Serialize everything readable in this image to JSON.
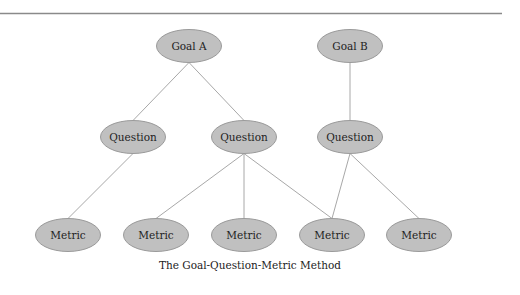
{
  "diagram": {
    "caption": "The Goal-Question-Metric Method",
    "colors": {
      "node_fill": "#c0c0c0",
      "node_stroke": "#9a9a9a",
      "edge": "#a8a8a8",
      "rule": "#8a8a8a"
    },
    "nodes": [
      {
        "id": "goal-a",
        "label": "Goal A",
        "cx": 189,
        "cy": 46,
        "level": "goal"
      },
      {
        "id": "goal-b",
        "label": "Goal B",
        "cx": 350,
        "cy": 46,
        "level": "goal"
      },
      {
        "id": "question-1",
        "label": "Question",
        "cx": 133,
        "cy": 137,
        "level": "question"
      },
      {
        "id": "question-2",
        "label": "Question",
        "cx": 244,
        "cy": 137,
        "level": "question"
      },
      {
        "id": "question-3",
        "label": "Question",
        "cx": 350,
        "cy": 137,
        "level": "question"
      },
      {
        "id": "metric-1",
        "label": "Metric",
        "cx": 68,
        "cy": 235,
        "level": "metric"
      },
      {
        "id": "metric-2",
        "label": "Metric",
        "cx": 156,
        "cy": 235,
        "level": "metric"
      },
      {
        "id": "metric-3",
        "label": "Metric",
        "cx": 244,
        "cy": 235,
        "level": "metric"
      },
      {
        "id": "metric-4",
        "label": "Metric",
        "cx": 332,
        "cy": 235,
        "level": "metric"
      },
      {
        "id": "metric-5",
        "label": "Metric",
        "cx": 419,
        "cy": 235,
        "level": "metric"
      }
    ],
    "edges": [
      {
        "from": "goal-a",
        "to": "question-1"
      },
      {
        "from": "goal-a",
        "to": "question-2"
      },
      {
        "from": "goal-b",
        "to": "question-3"
      },
      {
        "from": "question-1",
        "to": "metric-1"
      },
      {
        "from": "question-2",
        "to": "metric-2"
      },
      {
        "from": "question-2",
        "to": "metric-3"
      },
      {
        "from": "question-2",
        "to": "metric-4"
      },
      {
        "from": "question-3",
        "to": "metric-4"
      },
      {
        "from": "question-3",
        "to": "metric-5"
      }
    ]
  }
}
